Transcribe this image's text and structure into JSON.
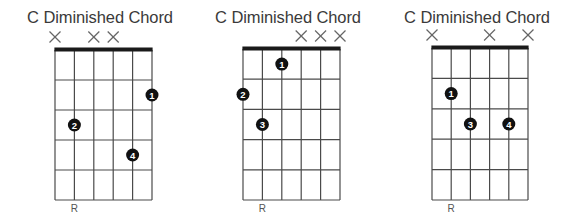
{
  "chords": [
    {
      "title": "C Diminished Chord",
      "left": 0,
      "grid": {
        "x0": 55,
        "x1": 152,
        "y_nut": 50,
        "y_bottom": 200,
        "frets": 5,
        "strings": 6
      },
      "muted_strings": [
        1,
        3,
        4
      ],
      "fingers": [
        {
          "finger": "1",
          "string": 6,
          "fret": 2
        },
        {
          "finger": "2",
          "string": 2,
          "fret": 3
        },
        {
          "finger": "4",
          "string": 5,
          "fret": 4
        }
      ],
      "root_label": "R",
      "root_string": 2
    },
    {
      "title": "C Diminished Chord",
      "left": 0,
      "grid": {
        "x0": 243,
        "x1": 340,
        "y_nut": 49,
        "y_bottom": 200,
        "frets": 5,
        "strings": 6
      },
      "muted_strings": [
        4,
        5,
        6
      ],
      "fingers": [
        {
          "finger": "1",
          "string": 3,
          "fret": 1
        },
        {
          "finger": "2",
          "string": 1,
          "fret": 2
        },
        {
          "finger": "3",
          "string": 2,
          "fret": 3
        }
      ],
      "root_label": "R",
      "root_string": 2
    },
    {
      "title": "C Diminished Chord",
      "left": 0,
      "grid": {
        "x0": 432,
        "x1": 528,
        "y_nut": 48,
        "y_bottom": 200,
        "frets": 5,
        "strings": 6
      },
      "muted_strings": [
        1,
        4,
        6
      ],
      "fingers": [
        {
          "finger": "1",
          "string": 2,
          "fret": 2
        },
        {
          "finger": "3",
          "string": 3,
          "fret": 3
        },
        {
          "finger": "4",
          "string": 5,
          "fret": 3
        }
      ],
      "root_label": "R",
      "root_string": 2
    }
  ],
  "style": {
    "line_color": "#4a4a4a",
    "nut_color": "#1a1a1a",
    "dot_color": "#111111",
    "dot_text_color": "#ffffff",
    "mute_color": "#666666"
  }
}
